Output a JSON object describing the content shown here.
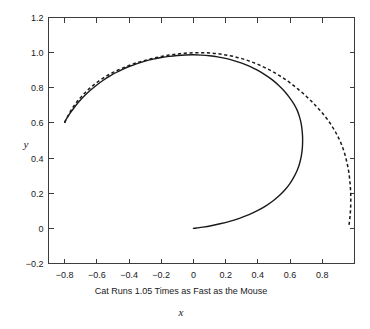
{
  "chart_data": {
    "type": "line",
    "title": "",
    "caption": "Cat Runs 1.05 Times as Fast as the Mouse",
    "xlabel": "x",
    "ylabel": "y",
    "xlim": [
      -0.9,
      1.0
    ],
    "ylim": [
      -0.2,
      1.2
    ],
    "grid": false,
    "legend": "none",
    "xticks": [
      -0.8,
      -0.6,
      -0.4,
      -0.2,
      0,
      0.2,
      0.4,
      0.6,
      0.8
    ],
    "xtick_labels": [
      "-0.8",
      "-0.6",
      "-0.4",
      "-0.2",
      "0",
      "0.2",
      "0.4",
      "0.6",
      "0.8"
    ],
    "yticks": [
      -0.2,
      0,
      0.2,
      0.4,
      0.6,
      0.8,
      1.0,
      1.2
    ],
    "ytick_labels": [
      "-0.2",
      "0",
      "0.2",
      "0.4",
      "0.6",
      "0.8",
      "1.0",
      "1.2"
    ],
    "series": [
      {
        "name": "cat-path-solid",
        "style": "solid",
        "color": "#1a1a1a",
        "points": [
          [
            -0.8,
            0.605
          ],
          [
            -0.77,
            0.65
          ],
          [
            -0.74,
            0.688
          ],
          [
            -0.71,
            0.722
          ],
          [
            -0.675,
            0.756
          ],
          [
            -0.64,
            0.786
          ],
          [
            -0.6,
            0.816
          ],
          [
            -0.56,
            0.843
          ],
          [
            -0.52,
            0.866
          ],
          [
            -0.48,
            0.887
          ],
          [
            -0.44,
            0.905
          ],
          [
            -0.4,
            0.921
          ],
          [
            -0.35,
            0.938
          ],
          [
            -0.3,
            0.952
          ],
          [
            -0.25,
            0.963
          ],
          [
            -0.2,
            0.972
          ],
          [
            -0.15,
            0.979
          ],
          [
            -0.1,
            0.984
          ],
          [
            -0.05,
            0.987
          ],
          [
            0.0,
            0.988
          ],
          [
            0.05,
            0.986
          ],
          [
            0.1,
            0.982
          ],
          [
            0.15,
            0.976
          ],
          [
            0.2,
            0.967
          ],
          [
            0.25,
            0.955
          ],
          [
            0.3,
            0.94
          ],
          [
            0.35,
            0.922
          ],
          [
            0.4,
            0.899
          ],
          [
            0.45,
            0.871
          ],
          [
            0.49,
            0.845
          ],
          [
            0.53,
            0.813
          ],
          [
            0.565,
            0.78
          ],
          [
            0.6,
            0.74
          ],
          [
            0.625,
            0.705
          ],
          [
            0.645,
            0.67
          ],
          [
            0.66,
            0.63
          ],
          [
            0.67,
            0.59
          ],
          [
            0.676,
            0.545
          ],
          [
            0.678,
            0.5
          ],
          [
            0.676,
            0.455
          ],
          [
            0.67,
            0.412
          ],
          [
            0.66,
            0.372
          ],
          [
            0.645,
            0.332
          ],
          [
            0.625,
            0.294
          ],
          [
            0.6,
            0.256
          ],
          [
            0.57,
            0.221
          ],
          [
            0.535,
            0.188
          ],
          [
            0.495,
            0.157
          ],
          [
            0.45,
            0.128
          ],
          [
            0.4,
            0.102
          ],
          [
            0.345,
            0.078
          ],
          [
            0.285,
            0.057
          ],
          [
            0.225,
            0.04
          ],
          [
            0.165,
            0.026
          ],
          [
            0.11,
            0.015
          ],
          [
            0.06,
            0.007
          ],
          [
            0.02,
            0.002
          ],
          [
            0.0,
            0.0
          ]
        ]
      },
      {
        "name": "mouse-path-dashed",
        "style": "dashed",
        "color": "#1a1a1a",
        "points": [
          [
            -0.8,
            0.6
          ],
          [
            -0.77,
            0.655
          ],
          [
            -0.74,
            0.7
          ],
          [
            -0.705,
            0.74
          ],
          [
            -0.67,
            0.775
          ],
          [
            -0.63,
            0.808
          ],
          [
            -0.59,
            0.837
          ],
          [
            -0.545,
            0.864
          ],
          [
            -0.5,
            0.887
          ],
          [
            -0.45,
            0.908
          ],
          [
            -0.4,
            0.927
          ],
          [
            -0.35,
            0.943
          ],
          [
            -0.3,
            0.956
          ],
          [
            -0.25,
            0.968
          ],
          [
            -0.2,
            0.978
          ],
          [
            -0.15,
            0.986
          ],
          [
            -0.1,
            0.992
          ],
          [
            -0.05,
            0.997
          ],
          [
            0.0,
            0.999
          ],
          [
            0.05,
            1.0
          ],
          [
            0.1,
            0.998
          ],
          [
            0.15,
            0.994
          ],
          [
            0.2,
            0.987
          ],
          [
            0.25,
            0.978
          ],
          [
            0.3,
            0.966
          ],
          [
            0.35,
            0.951
          ],
          [
            0.4,
            0.933
          ],
          [
            0.45,
            0.912
          ],
          [
            0.5,
            0.888
          ],
          [
            0.55,
            0.86
          ],
          [
            0.6,
            0.828
          ],
          [
            0.65,
            0.792
          ],
          [
            0.7,
            0.752
          ],
          [
            0.745,
            0.712
          ],
          [
            0.785,
            0.672
          ],
          [
            0.825,
            0.628
          ],
          [
            0.86,
            0.582
          ],
          [
            0.89,
            0.535
          ],
          [
            0.915,
            0.487
          ],
          [
            0.935,
            0.437
          ],
          [
            0.95,
            0.386
          ],
          [
            0.962,
            0.334
          ],
          [
            0.97,
            0.28
          ],
          [
            0.975,
            0.226
          ],
          [
            0.977,
            0.172
          ],
          [
            0.976,
            0.118
          ],
          [
            0.972,
            0.065
          ],
          [
            0.966,
            0.02
          ]
        ]
      }
    ]
  },
  "axes": {
    "y_label": "y",
    "x_label": "x"
  }
}
